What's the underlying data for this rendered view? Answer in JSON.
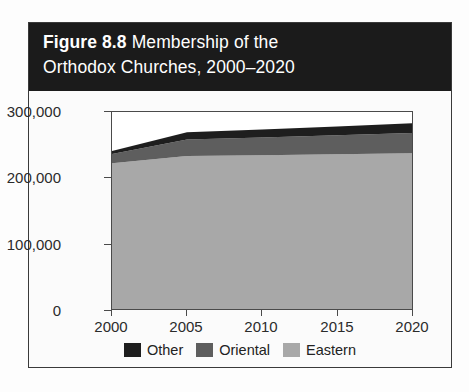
{
  "figure": {
    "label": "Figure 8.8",
    "title_rest": " Membership of the",
    "title_line2": "Orthodox Churches, 2000–2020"
  },
  "chart_data": {
    "type": "area",
    "stacked": true,
    "title": "Figure 8.8 Membership of the Orthodox Churches, 2000–2020",
    "xlabel": "",
    "ylabel": "",
    "x": [
      2000,
      2005,
      2010,
      2015,
      2020
    ],
    "xtick_labels": [
      "2000",
      "2005",
      "2010",
      "2015",
      "2020"
    ],
    "ytick_labels": [
      "0",
      "100,000",
      "200,000",
      "300,000"
    ],
    "ytick_values": [
      0,
      100000,
      200000,
      300000
    ],
    "ylim": [
      0,
      300000
    ],
    "xlim": [
      2000,
      2020
    ],
    "grid": false,
    "legend_position": "bottom",
    "series": [
      {
        "name": "Eastern",
        "color": "#a8a8a8",
        "values": [
          222000,
          233000,
          234000,
          235500,
          237000
        ]
      },
      {
        "name": "Oriental",
        "color": "#5e5e5e",
        "values": [
          14000,
          25000,
          27000,
          29000,
          31000
        ]
      },
      {
        "name": "Other",
        "color": "#1e1e1e",
        "values": [
          4500,
          11000,
          12500,
          13500,
          15000
        ]
      }
    ],
    "totals": [
      240500,
      269000,
      273500,
      278000,
      283000
    ],
    "legend_order_displayed": [
      "Other",
      "Oriental",
      "Eastern"
    ]
  },
  "colors": {
    "banner_background": "#1b1b1b",
    "banner_text": "#ffffff",
    "card_border": "#3a3a3a",
    "plot_background": "#ffffff",
    "axis": "#4a4a4a",
    "tick_text": "#2b2b2b"
  }
}
